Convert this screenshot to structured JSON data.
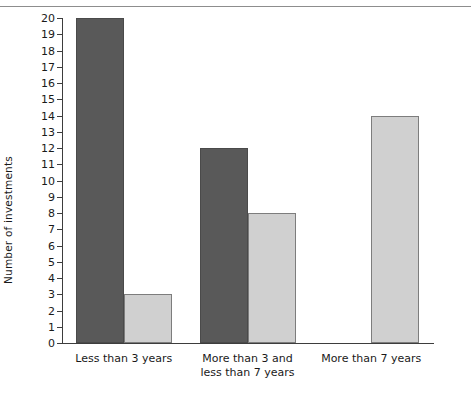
{
  "chart_data": {
    "type": "bar",
    "title": "",
    "xlabel": "",
    "ylabel": "Number of investments",
    "categories": [
      "Less than 3 years",
      "More than 3 and less than 7 years",
      "More than 7 years"
    ],
    "series": [
      {
        "name": "dark-series",
        "color": "#595959",
        "values": [
          20,
          12,
          0
        ]
      },
      {
        "name": "light-series",
        "color": "#d0d0d0",
        "values": [
          3,
          8,
          14
        ]
      }
    ],
    "ylim": [
      0,
      20
    ],
    "ytick_step": 1,
    "yticks": [
      0,
      1,
      2,
      3,
      4,
      5,
      6,
      7,
      8,
      9,
      10,
      11,
      12,
      13,
      14,
      15,
      16,
      17,
      18,
      19,
      20
    ],
    "grid": false,
    "legend": "none"
  },
  "category_lines": [
    [
      "Less than 3 years"
    ],
    [
      "More than 3 and",
      "less than 7 years"
    ],
    [
      "More than 7 years"
    ]
  ],
  "colors": {
    "dark_bar": "#595959",
    "light_bar": "#d0d0d0",
    "axis": "#3d3d3d",
    "background": "#ffffff"
  }
}
